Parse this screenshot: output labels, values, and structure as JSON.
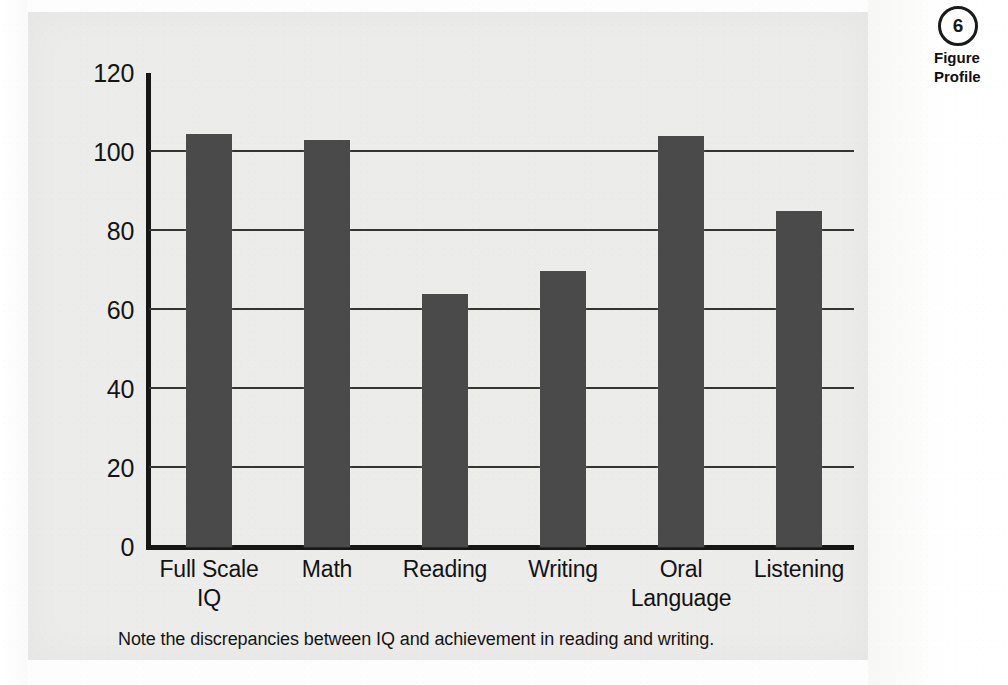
{
  "chart_data": {
    "type": "bar",
    "title": "",
    "subtitle": "",
    "xlabel": "",
    "ylabel": "",
    "ylim": [
      0,
      120
    ],
    "ytick_step": 20,
    "yticks": [
      "0",
      "20",
      "40",
      "60",
      "80",
      "100",
      "120"
    ],
    "grid": "horizontal",
    "legend": "none",
    "bar_color": "#4a4a4a",
    "categories": [
      "Full Scale IQ",
      "Math",
      "Reading",
      "Writing",
      "Oral Language",
      "Listening"
    ],
    "category_lines": [
      [
        "Full Scale",
        "IQ"
      ],
      [
        "Math"
      ],
      [
        "Reading"
      ],
      [
        "Writing"
      ],
      [
        "Oral",
        "Language"
      ],
      [
        "Listening"
      ]
    ],
    "values": [
      104.5,
      103,
      64,
      70,
      104,
      85
    ],
    "annotation": "Note the discrepancies between IQ and achievement in reading and writing."
  },
  "caption": {
    "text": "Note the discrepancies between IQ and achievement in reading and writing."
  },
  "margin": {
    "badge": "6",
    "note_line_1": "Figure",
    "note_line_2": "Profile"
  },
  "colors": {
    "bar": "#4a4a4a",
    "axis": "#161616",
    "gridline": "#35352f",
    "panel": "#ececea",
    "text": "#131313"
  }
}
